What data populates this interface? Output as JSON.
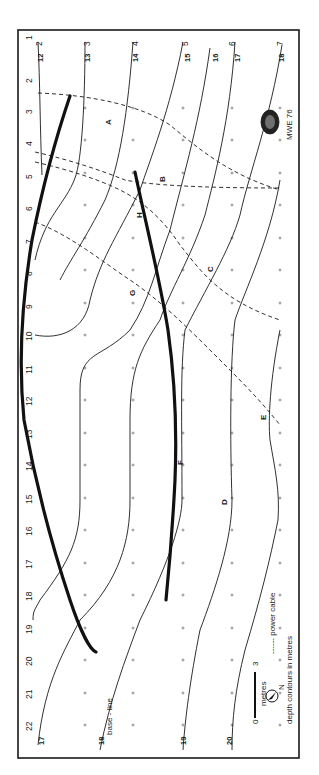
{
  "map": {
    "orientation": "rotated 90 degrees clockwise",
    "stations_left": [
      "1",
      "2",
      "3",
      "4",
      "5",
      "6",
      "7",
      "8",
      "9",
      "10",
      "11",
      "12",
      "13",
      "14",
      "15",
      "16",
      "17",
      "18",
      "19",
      "20",
      "21",
      "22"
    ],
    "columns_top": [
      "2",
      "3",
      "4",
      "5",
      "6",
      "7"
    ],
    "depth_labels_top": [
      "12",
      "13",
      "14",
      "15",
      "16",
      "17",
      "18"
    ],
    "depth_labels_bottom": [
      "17",
      "18",
      "19",
      "20"
    ],
    "site_letters": [
      "A",
      "B",
      "C",
      "D",
      "E",
      "F",
      "G",
      "H"
    ],
    "baseline_label": "base - line",
    "signature": "MWE 76",
    "colors": {
      "ink": "#1a1a1a",
      "paper": "#ffffff",
      "grid": "#555555"
    }
  },
  "legend": {
    "scale_start": "0",
    "scale_end": "3",
    "scale_unit": "metres",
    "north_label": "N",
    "cable_label": "------ power cable",
    "contour_label": "depth contours in metres"
  }
}
